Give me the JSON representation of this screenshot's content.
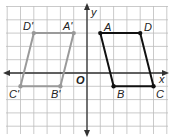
{
  "diagram": {
    "type": "coordinate-plane-reflection",
    "axes": {
      "x_label": "x",
      "y_label": "y",
      "origin_label": "O"
    },
    "grid": {
      "unit_px": 13.3,
      "origin_px": [
        87,
        73
      ],
      "x_range": [
        -6,
        6
      ],
      "y_range": [
        -5,
        5
      ]
    },
    "shapes": [
      {
        "name": "ABCD",
        "color": "#111111",
        "vertices": [
          {
            "label": "A",
            "x": 1,
            "y": 3
          },
          {
            "label": "D",
            "x": 4,
            "y": 3
          },
          {
            "label": "C",
            "x": 5,
            "y": -1
          },
          {
            "label": "B",
            "x": 2,
            "y": -1
          }
        ]
      },
      {
        "name": "A'B'C'D'",
        "color": "#999999",
        "vertices": [
          {
            "label": "A'",
            "x": -1,
            "y": 3
          },
          {
            "label": "D'",
            "x": -4,
            "y": 3
          },
          {
            "label": "C'",
            "x": -5,
            "y": -1
          },
          {
            "label": "B'",
            "x": -2,
            "y": -1
          }
        ]
      }
    ]
  },
  "labels": {
    "A": "A",
    "B": "B",
    "C": "C",
    "D": "D",
    "A_prime": "A'",
    "B_prime": "B'",
    "C_prime": "C'",
    "D_prime": "D'",
    "x": "x",
    "y": "y",
    "o": "O"
  }
}
